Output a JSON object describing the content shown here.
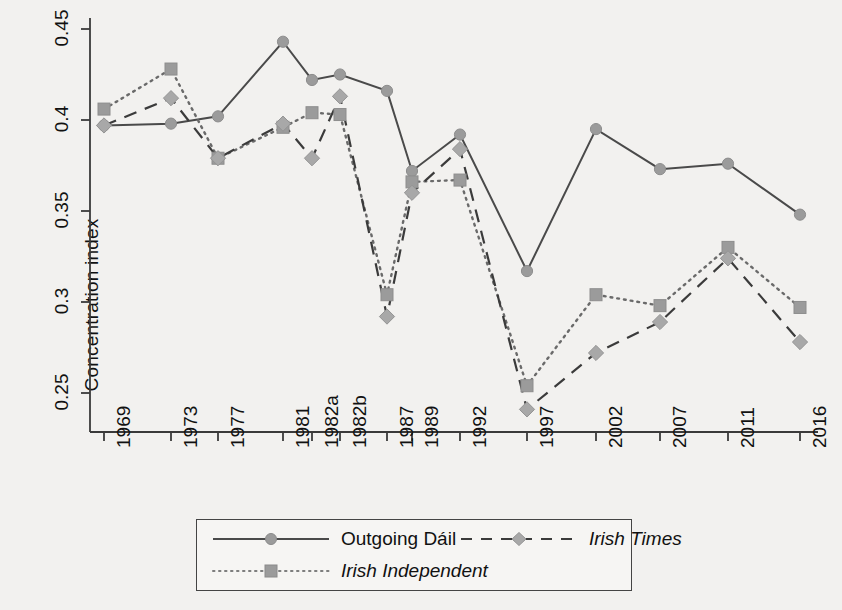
{
  "chart_data": {
    "type": "line",
    "title": "",
    "xlabel": "",
    "ylabel": "Concentration index",
    "categories": [
      "1969",
      "1973",
      "1977",
      "1981",
      "1982a",
      "1982b",
      "1987",
      "1989",
      "1992",
      "1997",
      "2002",
      "2007",
      "2011",
      "2016"
    ],
    "yticks": [
      0.25,
      0.3,
      0.35,
      0.4,
      0.45
    ],
    "ytick_labels": [
      "0.25",
      "0.3",
      "0.35",
      "0.4",
      "0.45"
    ],
    "ylim": [
      0.233,
      0.455
    ],
    "grid": false,
    "legend_position": "bottom",
    "series": [
      {
        "name": "Outgoing Dáil",
        "marker": "circle",
        "line_style": "solid",
        "color": "#4a4a4a",
        "marker_color": "#9b9b9b",
        "values": [
          0.397,
          0.398,
          0.402,
          0.443,
          0.422,
          0.425,
          0.416,
          0.372,
          0.392,
          0.317,
          0.395,
          0.373,
          0.376,
          0.348
        ]
      },
      {
        "name": "Irish Independent",
        "marker": "square",
        "line_style": "dotted",
        "color": "#6a6a6a",
        "marker_color": "#9b9b9b",
        "values": [
          0.406,
          0.428,
          0.379,
          0.396,
          0.404,
          0.403,
          0.304,
          0.366,
          0.367,
          0.254,
          0.304,
          0.298,
          0.33,
          0.297
        ]
      },
      {
        "name": "Irish Times",
        "marker": "diamond",
        "line_style": "dashed",
        "color": "#3b3b3b",
        "marker_color": "#a8a8a8",
        "values": [
          0.397,
          0.412,
          0.379,
          0.398,
          0.379,
          0.413,
          0.292,
          0.36,
          0.384,
          0.241,
          0.272,
          0.289,
          0.324,
          0.278
        ]
      }
    ]
  },
  "legend": {
    "items": [
      {
        "label": "Outgoing Dáil",
        "italic": false
      },
      {
        "label": "Irish Times",
        "italic": true
      },
      {
        "label": "Irish Independent",
        "italic": true
      }
    ]
  },
  "axes": {
    "y_title": "Concentration index"
  }
}
